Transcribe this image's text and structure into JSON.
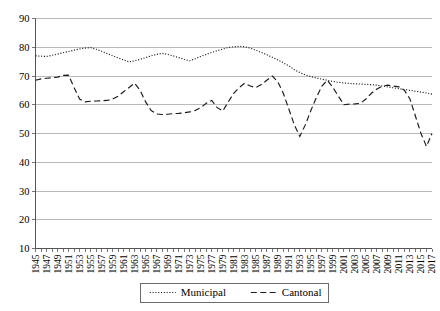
{
  "chart_data": {
    "type": "line",
    "title": "",
    "xlabel": "",
    "ylabel": "",
    "ylim": [
      10,
      90
    ],
    "ytick_values": [
      10,
      20,
      30,
      40,
      50,
      60,
      70,
      80,
      90
    ],
    "grid": true,
    "legend_position": "bottom-center",
    "x": [
      1945,
      1946,
      1947,
      1948,
      1949,
      1950,
      1951,
      1952,
      1953,
      1954,
      1955,
      1956,
      1957,
      1958,
      1959,
      1960,
      1961,
      1962,
      1963,
      1964,
      1965,
      1966,
      1967,
      1968,
      1969,
      1970,
      1971,
      1972,
      1973,
      1974,
      1975,
      1976,
      1977,
      1978,
      1979,
      1980,
      1981,
      1982,
      1983,
      1984,
      1985,
      1986,
      1987,
      1988,
      1989,
      1990,
      1991,
      1992,
      1993,
      1994,
      1995,
      1996,
      1997,
      1998,
      1999,
      2000,
      2001,
      2002,
      2003,
      2004,
      2005,
      2006,
      2007,
      2008,
      2009,
      2010,
      2011,
      2012,
      2013,
      2014,
      2015,
      2016,
      2017
    ],
    "xtick_labels": [
      "1945",
      "1947",
      "1949",
      "1951",
      "1953",
      "1955",
      "1957",
      "1959",
      "1961",
      "1963",
      "1965",
      "1967",
      "1969",
      "1971",
      "1973",
      "1975",
      "1977",
      "1979",
      "1981",
      "1983",
      "1985",
      "1987",
      "1989",
      "1991",
      "1993",
      "1995",
      "1997",
      "1999",
      "2001",
      "2003",
      "2005",
      "2007",
      "2009",
      "2011",
      "2013",
      "2015",
      "2017"
    ],
    "series": [
      {
        "name": "Municipal",
        "style": "dotted",
        "values": [
          77.0,
          76.9,
          76.8,
          77.2,
          77.6,
          78.1,
          78.5,
          79.0,
          79.4,
          79.7,
          79.9,
          79.3,
          78.6,
          77.8,
          77.0,
          76.3,
          75.6,
          74.9,
          75.3,
          75.8,
          76.4,
          77.0,
          77.5,
          77.9,
          77.5,
          77.0,
          76.4,
          75.8,
          75.3,
          76.0,
          76.8,
          77.5,
          78.2,
          78.8,
          79.4,
          79.9,
          80.2,
          80.3,
          80.2,
          79.7,
          79.0,
          78.2,
          77.4,
          76.5,
          75.6,
          74.6,
          73.5,
          72.2,
          71.2,
          70.4,
          69.8,
          69.3,
          68.9,
          68.5,
          68.1,
          67.8,
          67.6,
          67.4,
          67.3,
          67.2,
          67.1,
          67.0,
          66.8,
          66.5,
          66.2,
          65.9,
          65.6,
          65.3,
          65.0,
          64.7,
          64.4,
          64.1,
          63.7
        ]
      },
      {
        "name": "Cantonal",
        "style": "dashed",
        "values": [
          68.5,
          69.0,
          69.2,
          69.4,
          69.6,
          70.2,
          70.3,
          66.0,
          62.0,
          61.0,
          61.2,
          61.3,
          61.4,
          61.5,
          62.0,
          63.0,
          64.5,
          66.0,
          67.5,
          65.0,
          61.0,
          58.0,
          56.8,
          56.6,
          56.7,
          56.9,
          57.0,
          57.2,
          57.5,
          58.0,
          59.0,
          60.5,
          61.5,
          59.0,
          57.8,
          61.0,
          64.0,
          66.0,
          67.5,
          66.5,
          66.0,
          67.0,
          68.5,
          70.0,
          68.0,
          64.0,
          58.5,
          53.0,
          49.0,
          53.0,
          58.0,
          62.5,
          66.5,
          68.5,
          66.0,
          63.0,
          60.0,
          60.2,
          60.3,
          60.5,
          62.0,
          64.0,
          65.5,
          66.5,
          66.8,
          66.5,
          66.2,
          65.0,
          62.0,
          56.0,
          50.0,
          45.5,
          50.0
        ]
      }
    ]
  },
  "legend": {
    "items": [
      {
        "label": "Municipal",
        "style": "dotted"
      },
      {
        "label": "Cantonal",
        "style": "dashed"
      }
    ]
  }
}
